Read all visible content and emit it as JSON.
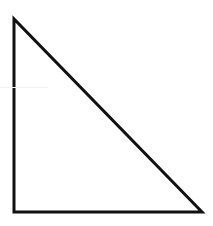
{
  "diagram": {
    "shape": "right-triangle",
    "stroke_color": "#111111",
    "fill_color": "#ffffff",
    "stroke_width": 3,
    "vertices": {
      "top_left": [
        14,
        19
      ],
      "bottom_left": [
        14,
        212
      ],
      "bottom_right": [
        202,
        212
      ]
    },
    "background": "#ffffff"
  }
}
